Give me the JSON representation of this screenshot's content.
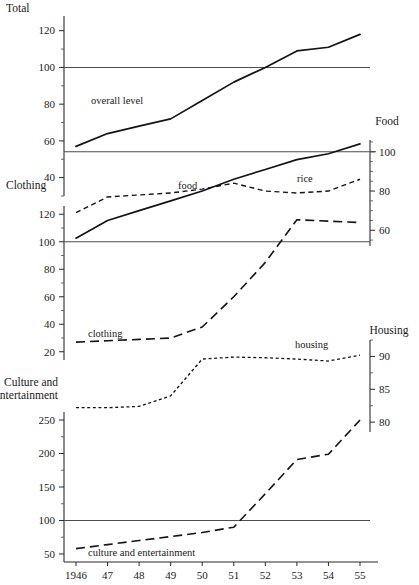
{
  "chart_data": {
    "type": "line",
    "title": "",
    "subtitle": "",
    "xlabel": "",
    "ylabel": "",
    "grid": false,
    "legend_position": "inline-annotations",
    "x": [
      "1946",
      "47",
      "48",
      "49",
      "50",
      "51",
      "52",
      "53",
      "54",
      "55"
    ],
    "panels": [
      {
        "name": "total-food-panel",
        "left_axis": {
          "title": "Total",
          "ticks": [
            40,
            60,
            80,
            100,
            120
          ],
          "minor_step": 10,
          "range": [
            30,
            128
          ]
        },
        "right_axis": {
          "title": "Food",
          "ticks": [
            60,
            80,
            100
          ],
          "minor_step": 5,
          "range": [
            52,
            106
          ]
        },
        "reference_lines": [
          {
            "axis": "left",
            "value": 100
          },
          {
            "axis": "right",
            "value": 100
          }
        ],
        "series": [
          {
            "name": "overall level",
            "label": "overall level",
            "axis": "left",
            "style": "solid",
            "values": [
              57,
              64,
              68,
              72,
              82,
              92,
              100,
              109,
              111,
              118
            ]
          },
          {
            "name": "food",
            "label": "food",
            "axis": "right",
            "style": "solid",
            "values": [
              56,
              65,
              70,
              75,
              80,
              86,
              91,
              96,
              99,
              104
            ]
          },
          {
            "name": "rice",
            "label": "rice",
            "axis": "right",
            "style": "dashed-medium",
            "values": [
              69,
              77,
              78,
              79,
              81,
              84,
              80,
              79,
              80,
              86
            ]
          }
        ]
      },
      {
        "name": "clothing-housing-panel",
        "left_axis": {
          "title": "Clothing",
          "ticks": [
            20,
            40,
            60,
            80,
            100,
            120
          ],
          "minor_step": 10,
          "range": [
            14,
            126
          ]
        },
        "right_axis": {
          "title": "Housing",
          "ticks": [
            80,
            85,
            90
          ],
          "minor_step": 2.5,
          "range": [
            78.5,
            92.5
          ]
        },
        "reference_lines": [
          {
            "axis": "left",
            "value": 100
          }
        ],
        "series": [
          {
            "name": "clothing",
            "label": "clothing",
            "axis": "left",
            "style": "dashed-long",
            "values": [
              27,
              28,
              29,
              30,
              38,
              60,
              85,
              116,
              115,
              114
            ]
          },
          {
            "name": "housing",
            "label": "housing",
            "axis": "right",
            "style": "dotted",
            "values": [
              82.2,
              82.2,
              82.4,
              84.0,
              89.6,
              89.9,
              89.8,
              89.6,
              89.3,
              90.2
            ]
          }
        ]
      },
      {
        "name": "culture-panel",
        "left_axis": {
          "title": "Culture and entertainment",
          "ticks": [
            50,
            100,
            150,
            200,
            250
          ],
          "minor_step": 25,
          "range": [
            38,
            262
          ]
        },
        "right_axis": null,
        "reference_lines": [
          {
            "axis": "left",
            "value": 100
          }
        ],
        "series": [
          {
            "name": "culture and entertainment",
            "label": "culture and entertainment",
            "axis": "left",
            "style": "dashed-long",
            "values": [
              58,
              64,
              70,
              76,
              82,
              90,
              140,
              191,
              199,
              250
            ]
          }
        ]
      }
    ]
  },
  "axis_titles": {
    "total": "Total",
    "food": "Food",
    "clothing": "Clothing",
    "housing": "Housing",
    "culture_line1": "Culture and",
    "culture_line2": "entertainment"
  },
  "series_labels": {
    "overall_level": "overall level",
    "food": "food",
    "rice": "rice",
    "clothing": "clothing",
    "housing": "housing",
    "culture": "culture and entertainment"
  },
  "tick_labels": {
    "total": [
      "120",
      "100",
      "80",
      "60",
      "40"
    ],
    "food": [
      "100",
      "80",
      "60"
    ],
    "clothing": [
      "120",
      "100",
      "80",
      "60",
      "40",
      "20"
    ],
    "housing": [
      "90",
      "85",
      "80"
    ],
    "culture": [
      "250",
      "200",
      "150",
      "100",
      "50"
    ],
    "x": [
      "1946",
      "47",
      "48",
      "49",
      "50",
      "51",
      "52",
      "53",
      "54",
      "55"
    ]
  },
  "colors": {
    "ink": "#141414",
    "axis": "#2b2b2b",
    "reference": "#4d4d4d",
    "background": "#ffffff"
  }
}
